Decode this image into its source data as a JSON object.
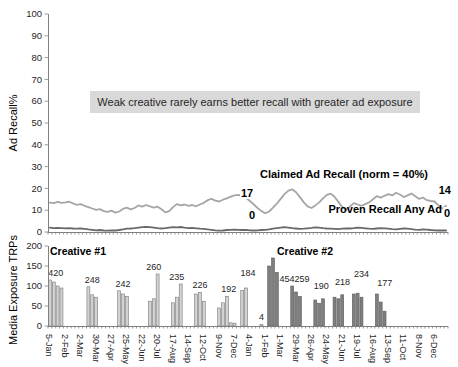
{
  "chart_data": [
    {
      "type": "line",
      "panel": "top",
      "ylabel": "Ad Recall%",
      "ylim": [
        0,
        100
      ],
      "yticks": [
        0,
        10,
        20,
        30,
        40,
        50,
        60,
        70,
        80,
        90,
        100
      ],
      "annotation": "Weak creative rarely earns better recall with greater ad exposure",
      "series": [
        {
          "name": "Claimed Ad Recall (norm = 40%)",
          "color": "#a6a6a6",
          "point_labels": [
            {
              "week": 51,
              "text": "17"
            },
            {
              "week": 103,
              "text": "14"
            }
          ],
          "values": [
            13.5,
            13.2,
            13.8,
            13.4,
            13.6,
            13.9,
            13.1,
            12.5,
            12.8,
            12.0,
            11.4,
            10.8,
            10.2,
            10.5,
            9.6,
            9.2,
            9.8,
            8.9,
            9.4,
            10.6,
            11.2,
            10.4,
            11.0,
            12.2,
            11.6,
            12.4,
            11.8,
            11.2,
            11.6,
            10.4,
            9.0,
            9.6,
            11.4,
            12.8,
            12.2,
            12.6,
            12.0,
            12.4,
            11.8,
            12.6,
            13.4,
            14.6,
            15.2,
            14.4,
            14.0,
            14.8,
            15.4,
            16.2,
            16.8,
            17.0,
            16.4,
            15.6,
            14.2,
            12.6,
            11.0,
            9.6,
            8.6,
            9.4,
            11.2,
            13.0,
            15.2,
            17.4,
            19.0,
            19.6,
            18.2,
            16.0,
            13.6,
            11.8,
            11.0,
            12.2,
            13.6,
            15.4,
            17.0,
            17.6,
            16.2,
            13.8,
            11.4,
            10.2,
            11.6,
            13.2,
            12.6,
            12.0,
            12.8,
            13.6,
            15.0,
            16.4,
            15.8,
            16.6,
            17.4,
            16.8,
            18.0,
            17.2,
            16.0,
            16.8,
            17.6,
            16.4,
            15.2,
            15.8,
            14.6,
            14.2,
            14.0,
            12.2,
            10.8,
            12.0
          ]
        },
        {
          "name": "Proven Recall Any Ad",
          "color": "#696969",
          "point_labels": [
            {
              "week": 53,
              "text": "0"
            },
            {
              "week": 103,
              "text": "0"
            }
          ],
          "values": [
            2.0,
            1.8,
            1.9,
            1.8,
            1.7,
            1.8,
            1.6,
            1.5,
            1.6,
            1.4,
            1.2,
            1.0,
            0.8,
            0.9,
            0.7,
            0.6,
            0.8,
            0.7,
            0.9,
            1.2,
            1.5,
            1.6,
            1.8,
            2.0,
            2.2,
            2.4,
            2.2,
            2.0,
            1.8,
            1.6,
            1.8,
            2.0,
            2.2,
            2.1,
            2.3,
            2.0,
            1.8,
            1.9,
            1.7,
            1.5,
            1.4,
            1.2,
            1.0,
            0.8,
            0.6,
            0.7,
            0.9,
            1.0,
            1.1,
            1.0,
            0.9,
            1.0,
            0.8,
            0.7,
            0.8,
            0.9,
            1.0,
            1.2,
            1.5,
            1.8,
            2.0,
            2.2,
            2.0,
            1.8,
            1.6,
            1.4,
            1.5,
            1.7,
            1.9,
            2.1,
            2.0,
            1.8,
            1.6,
            1.5,
            1.4,
            1.3,
            1.5,
            1.7,
            1.6,
            1.8,
            2.0,
            1.9,
            1.7,
            1.5,
            1.4,
            1.6,
            1.8,
            1.7,
            1.5,
            1.3,
            1.2,
            1.4,
            1.6,
            1.5,
            1.3,
            1.1,
            1.0,
            1.2,
            1.1,
            0.9,
            0.8,
            0.7,
            0.8,
            0.7
          ]
        }
      ]
    },
    {
      "type": "bar",
      "panel": "bottom",
      "ylabel": "Media Exposure TRPs",
      "ylim": [
        0,
        200
      ],
      "yticks": [
        0,
        50,
        100,
        150,
        200
      ],
      "weeks_per_label": 4,
      "categories": [
        "5-Jan",
        "2-Feb",
        "2-Mar",
        "30-Mar",
        "27-Apr",
        "25-May",
        "22-Jun",
        "20-Jul",
        "17-Aug",
        "14-Sep",
        "12-Oct",
        "9-Nov",
        "7-Dec",
        "4-Jan",
        "1-Feb",
        "1-Mar",
        "29-Mar",
        "26-Apr",
        "24-May",
        "21-Jun",
        "19-Jul",
        "16-Aug",
        "13-Sep",
        "11-Oct",
        "8-Nov",
        "6-Dec"
      ],
      "series": [
        {
          "name": "Creative #1",
          "fill": "#d2d2d2",
          "stroke": "#7a7a7a",
          "values": [
            115,
            110,
            100,
            95,
            0,
            0,
            0,
            0,
            0,
            0,
            98,
            78,
            72,
            0,
            0,
            0,
            0,
            0,
            88,
            80,
            74,
            0,
            0,
            0,
            0,
            0,
            62,
            68,
            130,
            0,
            0,
            0,
            58,
            72,
            105,
            0,
            0,
            0,
            80,
            84,
            62,
            0,
            0,
            0,
            45,
            58,
            74,
            8,
            7,
            0,
            89,
            95,
            0,
            0,
            0,
            4,
            0,
            0,
            0,
            0,
            0,
            0,
            0,
            0,
            0,
            0,
            0,
            0,
            0,
            0,
            0,
            0,
            0,
            0,
            0,
            0,
            0,
            0,
            0,
            0,
            0,
            0,
            0,
            0,
            0,
            0,
            0,
            0,
            0,
            0,
            0,
            0,
            0,
            0,
            0,
            0,
            0,
            0,
            0,
            0,
            0,
            0,
            0,
            0
          ]
        },
        {
          "name": "Creative #2",
          "fill": "#7f7f7f",
          "stroke": "#5e5e5e",
          "values": [
            0,
            0,
            0,
            0,
            0,
            0,
            0,
            0,
            0,
            0,
            0,
            0,
            0,
            0,
            0,
            0,
            0,
            0,
            0,
            0,
            0,
            0,
            0,
            0,
            0,
            0,
            0,
            0,
            0,
            0,
            0,
            0,
            0,
            0,
            0,
            0,
            0,
            0,
            0,
            0,
            0,
            0,
            0,
            0,
            0,
            0,
            0,
            0,
            0,
            0,
            0,
            0,
            0,
            0,
            0,
            0,
            0,
            150,
            170,
            134,
            0,
            0,
            0,
            100,
            85,
            74,
            0,
            0,
            0,
            65,
            57,
            68,
            0,
            0,
            72,
            68,
            78,
            0,
            0,
            80,
            82,
            72,
            0,
            0,
            0,
            80,
            60,
            37,
            0,
            0,
            0,
            0,
            0,
            0,
            0,
            0,
            0,
            0,
            0,
            0,
            0,
            0,
            0,
            0
          ]
        }
      ],
      "bar_labels": [
        {
          "week": 1,
          "text": "420",
          "series": 0,
          "dx": 2
        },
        {
          "week": 11,
          "text": "248",
          "series": 0
        },
        {
          "week": 19,
          "text": "242",
          "series": 0
        },
        {
          "week": 27,
          "text": "260",
          "series": 0
        },
        {
          "week": 33,
          "text": "235",
          "series": 0
        },
        {
          "week": 39,
          "text": "226",
          "series": 0
        },
        {
          "week": 46,
          "text": "192",
          "series": 0,
          "dx": 2
        },
        {
          "week": 51,
          "text": "184",
          "series": 0,
          "dx": 2,
          "dy": -8
        },
        {
          "week": 55,
          "text": "4",
          "series": 0
        },
        {
          "week": 58,
          "text": "454",
          "series": 1,
          "dx": 14,
          "dy": 28
        },
        {
          "week": 64,
          "text": "259",
          "series": 1,
          "dx": 6
        },
        {
          "week": 70,
          "text": "190",
          "series": 1,
          "dx": 2,
          "dy": -6
        },
        {
          "week": 75,
          "text": "218",
          "series": 1,
          "dx": 4,
          "dy": -6
        },
        {
          "week": 80,
          "text": "234",
          "series": 1,
          "dx": 4,
          "dy": -12
        },
        {
          "week": 86,
          "text": "177",
          "series": 1,
          "dx": 4,
          "dy": -4
        }
      ]
    }
  ],
  "colors": {
    "axis": "#808080",
    "tick_text": "#262626",
    "annotation_bg": "#d9d9d9"
  }
}
